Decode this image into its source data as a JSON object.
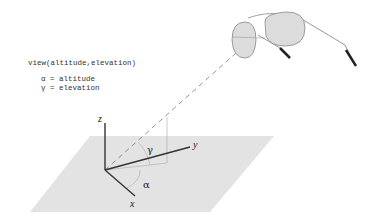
{
  "code": {
    "call": "view(altitude,elevation)",
    "line1": "α = altitude",
    "line2": "γ = elevation"
  },
  "axes": {
    "x": "x",
    "y": "y",
    "z": "z"
  },
  "angles": {
    "alpha": "α",
    "gamma": "γ"
  },
  "colors": {
    "plane": "#e3e3e3",
    "axis": "#333333",
    "guide": "#999999",
    "lens": "#dcdcdc",
    "frame": "#888888"
  }
}
